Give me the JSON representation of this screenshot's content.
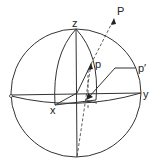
{
  "figure": {
    "type": "stereographic-projection-sphere",
    "labels": {
      "z": "z",
      "x": "x",
      "y": "y",
      "P": "P",
      "p": "p",
      "p_prime": "p′"
    },
    "color": "#333333"
  }
}
